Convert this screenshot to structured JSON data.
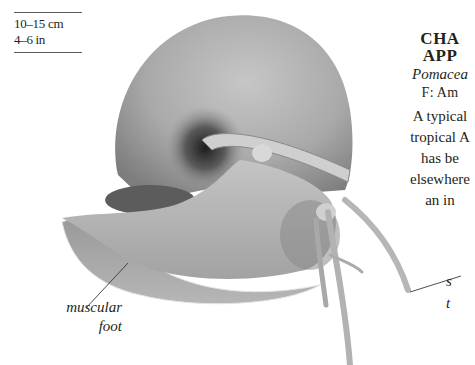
{
  "size_box": {
    "metric": "10–15 cm",
    "imperial": "4–6 in"
  },
  "header": {
    "title_line1": "CHA",
    "title_line2": "APP",
    "scientific_name": "Pomacea",
    "family": "F: Am"
  },
  "description": {
    "lines": [
      "A typical",
      "tropical A",
      "has be",
      "elsewhere",
      "an in"
    ]
  },
  "annotations": {
    "foot_line1": "muscular",
    "foot_line2": "foot",
    "siphon_line1": "s",
    "siphon_line2": "t"
  },
  "colors": {
    "text": "#231f20",
    "shell": "#a6a6a6",
    "body": "#bcbcbc",
    "shadow": "#6e6e6e"
  }
}
